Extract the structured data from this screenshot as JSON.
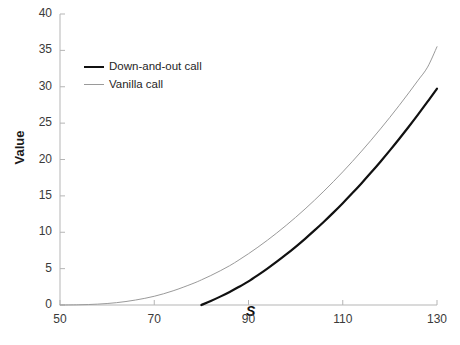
{
  "chart_data": {
    "type": "line",
    "title": "",
    "xlabel": "S",
    "ylabel": "Value",
    "xlim": [
      50,
      130
    ],
    "ylim": [
      0,
      40
    ],
    "xticks": [
      50,
      70,
      90,
      110,
      130
    ],
    "yticks": [
      0,
      5,
      10,
      15,
      20,
      25,
      30,
      35,
      40
    ],
    "grid": false,
    "legend_position": "upper-left-inside",
    "series": [
      {
        "name": "Down-and-out call",
        "color": "#111111",
        "width": 2.2,
        "x": [
          80,
          82,
          84,
          86,
          88,
          90,
          92,
          94,
          96,
          98,
          100,
          102,
          104,
          106,
          108,
          110,
          112,
          114,
          116,
          118,
          120,
          122,
          124,
          126,
          128,
          130
        ],
        "values": [
          0.0,
          0.55,
          1.15,
          1.8,
          2.5,
          3.25,
          4.1,
          5.0,
          5.95,
          6.95,
          8.0,
          9.1,
          10.25,
          11.45,
          12.7,
          14.0,
          15.35,
          16.75,
          18.2,
          19.7,
          21.25,
          22.85,
          24.5,
          26.2,
          27.95,
          29.75
        ]
      },
      {
        "name": "Vanilla call",
        "color": "#9a9a9a",
        "width": 1.0,
        "x": [
          50,
          54,
          58,
          62,
          66,
          70,
          74,
          78,
          80,
          82,
          84,
          86,
          88,
          90,
          92,
          94,
          96,
          98,
          100,
          102,
          104,
          106,
          108,
          110,
          112,
          114,
          116,
          118,
          120,
          122,
          124,
          126,
          128,
          130
        ],
        "values": [
          0.0,
          0.03,
          0.12,
          0.32,
          0.68,
          1.2,
          1.95,
          2.9,
          3.45,
          4.05,
          4.7,
          5.4,
          6.2,
          7.05,
          7.95,
          8.9,
          9.9,
          10.95,
          12.05,
          13.2,
          14.4,
          15.65,
          16.95,
          18.3,
          19.7,
          21.15,
          22.65,
          24.2,
          25.8,
          27.45,
          29.15,
          30.9,
          32.7,
          35.5
        ]
      }
    ],
    "legend": [
      "Down-and-out call",
      "Vanilla call"
    ],
    "annotations": []
  },
  "axis": {
    "y_title": "Value",
    "x_title": "S",
    "x_tick_labels": [
      "50",
      "70",
      "90",
      "110",
      "130"
    ],
    "y_tick_labels": [
      "0",
      "5",
      "10",
      "15",
      "20",
      "25",
      "30",
      "35",
      "40"
    ],
    "axis_color": "#b5b5b5",
    "tick_label_color": "#3a3a3a"
  },
  "legend": {
    "items": [
      {
        "label": "Down-and-out call",
        "style": "thick",
        "color": "#111111"
      },
      {
        "label": "Vanilla call",
        "style": "thin",
        "color": "#9a9a9a"
      }
    ]
  }
}
